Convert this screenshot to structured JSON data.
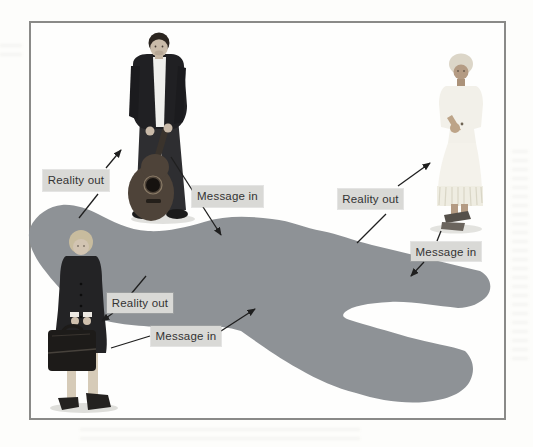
{
  "diagram": {
    "type": "communication-model-pool",
    "pool": {
      "shape": "gray-amoeba-blob"
    },
    "people": [
      {
        "id": "man-with-guitar",
        "position": "top-center"
      },
      {
        "id": "businesswoman-with-briefcase",
        "position": "bottom-left"
      },
      {
        "id": "elderly-woman",
        "position": "right"
      }
    ],
    "labels": {
      "man_reality_out": "Reality out",
      "man_message_in": "Message in",
      "woman_reality_out": "Reality out",
      "woman_message_in": "Message in",
      "lady_reality_out": "Reality out",
      "lady_message_in": "Message in"
    },
    "arrows": [
      {
        "label": "Reality out",
        "from": "pool",
        "to": "man-with-guitar"
      },
      {
        "label": "Message in",
        "from": "man-with-guitar",
        "to": "pool"
      },
      {
        "label": "Reality out",
        "from": "pool",
        "to": "businesswoman-with-briefcase"
      },
      {
        "label": "Message in",
        "from": "businesswoman-with-briefcase",
        "to": "pool"
      },
      {
        "label": "Reality out",
        "from": "pool",
        "to": "elderly-woman"
      },
      {
        "label": "Message in",
        "from": "elderly-woman",
        "to": "pool"
      }
    ],
    "colors": {
      "pool_gray": "#8e9296",
      "label_bg": "#d9d9d6",
      "label_text": "#333333",
      "frame_border": "#8a8a88",
      "arrow": "#1f1f1f",
      "page_bg": "#fdfdfb"
    }
  }
}
